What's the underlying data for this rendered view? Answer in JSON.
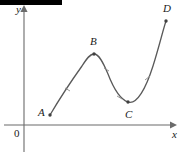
{
  "figure": {
    "title_bar": {
      "name": "redaction-bar",
      "color": "#000000",
      "x": 0,
      "y": 0,
      "width": 62,
      "height": 5
    },
    "background_color": "#ffffff",
    "stroke_color": "#595959",
    "axis_color": "#6b6b6b"
  },
  "chart_data": {
    "type": "line",
    "title": "",
    "xlabel": "x",
    "ylabel": "y",
    "origin_label": "0",
    "grid": false,
    "legend": false,
    "axes": {
      "x_axis": {
        "y_pixel": 125,
        "x_start": 4,
        "x_end": 172,
        "arrow": "right"
      },
      "y_axis": {
        "x_pixel": 24,
        "y_start": 8,
        "y_end": 152,
        "arrow": "up"
      }
    },
    "curve_description": "Smooth cubic-like curve rising from A to a local maximum at B, falling to a local minimum at C, then rising steeply to D",
    "points": [
      {
        "label": "A",
        "role": "start-point",
        "x": 50,
        "y": 115
      },
      {
        "label": "B",
        "role": "local-maximum",
        "x": 94,
        "y": 54
      },
      {
        "label": "C",
        "role": "local-minimum",
        "x": 128,
        "y": 102
      },
      {
        "label": "D",
        "role": "end-point",
        "x": 166,
        "y": 21
      }
    ],
    "path": "M 50 115 C 60 98, 72 80, 82 66 C 87 58, 90 54, 94 54 C 99 54, 103 62, 108 74 C 113 87, 119 99, 128 102 C 137 105, 146 88, 153 66 C 159 47, 163 30, 166 21"
  }
}
